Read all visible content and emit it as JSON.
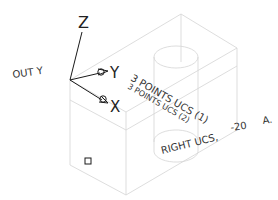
{
  "drawing": {
    "axis_labels": {
      "z": "Z",
      "y": "Y",
      "x": "X"
    },
    "view_label": "OUT Y",
    "annotations": {
      "line1": "3 POINTS UCS (1)",
      "line2": "3 POINTS UCS (2)",
      "line3": "RIGHT UCS,",
      "dimension": "-20",
      "suffix": "A."
    },
    "colors": {
      "edges": "#d4d4d4",
      "axes": "#1a1a1a",
      "text": "#222222",
      "background": "#ffffff"
    }
  }
}
